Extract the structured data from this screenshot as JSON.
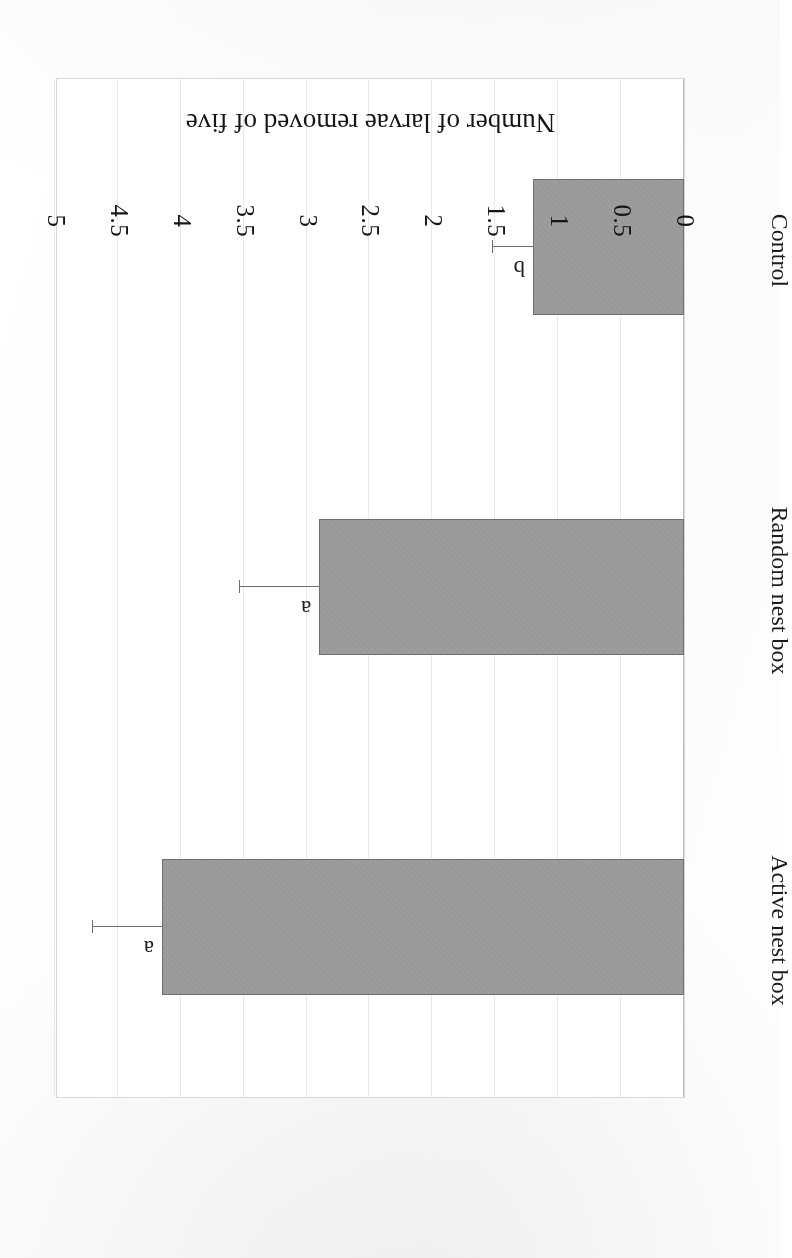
{
  "figure": {
    "rotation_degrees": 180,
    "background_color": "#ffffff",
    "bar_fill_color": "#9b9b9b",
    "bar_border_color": "#6f6f6f",
    "gridline_color": "#e9e9e9",
    "axis_color": "#bdbdbd",
    "text_color": "#151515"
  },
  "chart_data": {
    "type": "bar",
    "orientation": "horizontal",
    "title": "",
    "xlabel": "",
    "ylabel": "Number of larvae removed of five",
    "categories": [
      "Active nest box",
      "Random nest box",
      "Control"
    ],
    "values": [
      4.15,
      2.9,
      1.2
    ],
    "errors": [
      0.55,
      0.63,
      0.32
    ],
    "error_type": "error-bar",
    "annotations": [
      "a",
      "a",
      "b"
    ],
    "value_axis_label": "Number of larvae removed of five",
    "ylim": [
      0,
      5
    ],
    "tick_labels": [
      "0",
      "0.5",
      "1",
      "1.5",
      "2",
      "2.5",
      "3",
      "3.5",
      "4",
      "4.5",
      "5"
    ],
    "tick_values": [
      0,
      0.5,
      1,
      1.5,
      2,
      2.5,
      3,
      3.5,
      4,
      4.5,
      5
    ],
    "grid": true,
    "legend": "none"
  }
}
